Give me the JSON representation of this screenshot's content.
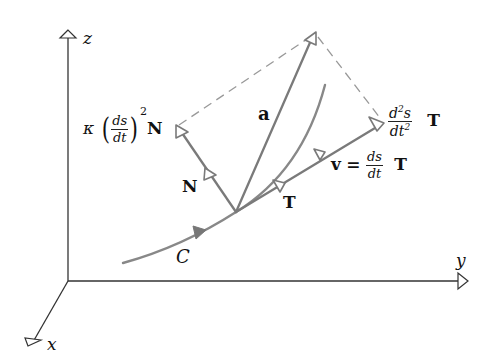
{
  "diagram": {
    "axes": {
      "z_label": "z",
      "y_label": "y",
      "x_label": "x"
    },
    "curve": {
      "label": "C"
    },
    "vectors": {
      "acceleration_label": "a",
      "normal_unit_label": "N",
      "tangent_unit_label": "T",
      "normal_component": {
        "kappa": "κ",
        "num": "ds",
        "den": "dt",
        "exponent": "2",
        "vector": "N"
      },
      "tangential_component": {
        "num_d": "d",
        "num_exp": "2",
        "num_s": "s",
        "den_dt": "dt",
        "den_exp": "2",
        "vector": "T"
      },
      "velocity": {
        "lhs": "v",
        "eq": "=",
        "num": "ds",
        "den": "dt",
        "vector": "T"
      }
    },
    "colors": {
      "axis": "#333333",
      "vector": "#7a7a7a",
      "dashed": "#9a9a9a",
      "text": "#111111"
    }
  }
}
